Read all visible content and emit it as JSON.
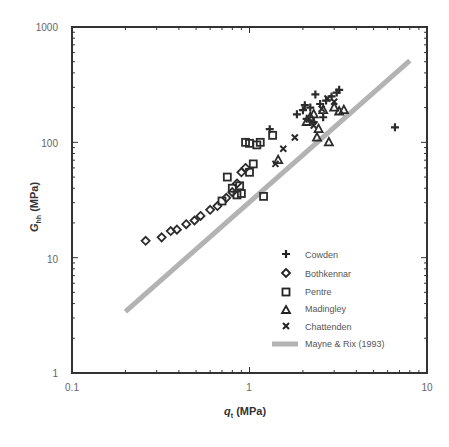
{
  "chart_data": {
    "type": "scatter",
    "title": "",
    "xlabel": "q_t (MPa)",
    "ylabel": "G_hh (MPa)",
    "xscale": "log",
    "yscale": "log",
    "xlim": [
      0.1,
      10
    ],
    "ylim": [
      1,
      1000
    ],
    "x_tick_labels": [
      "0.1",
      "1",
      "10"
    ],
    "y_tick_labels": [
      "1",
      "10",
      "100",
      "1000"
    ],
    "grid": false,
    "legend_position": "lower right (inside)",
    "series": [
      {
        "name": "Cowden",
        "marker": "plus",
        "points": [
          [
            1.3,
            130
          ],
          [
            1.85,
            175
          ],
          [
            2.0,
            190
          ],
          [
            2.1,
            160
          ],
          [
            2.2,
            200
          ],
          [
            2.35,
            260
          ],
          [
            2.5,
            215
          ],
          [
            2.6,
            165
          ],
          [
            2.7,
            230
          ],
          [
            2.9,
            250
          ],
          [
            3.1,
            270
          ],
          [
            3.2,
            285
          ],
          [
            2.3,
            150
          ],
          [
            2.05,
            210
          ],
          [
            6.6,
            135
          ]
        ]
      },
      {
        "name": "Bothkennar",
        "marker": "diamond",
        "points": [
          [
            0.26,
            14
          ],
          [
            0.32,
            15
          ],
          [
            0.36,
            17
          ],
          [
            0.39,
            17.5
          ],
          [
            0.44,
            19.5
          ],
          [
            0.49,
            21
          ],
          [
            0.53,
            23
          ],
          [
            0.6,
            26
          ],
          [
            0.66,
            28
          ],
          [
            0.74,
            33
          ],
          [
            0.8,
            37
          ],
          [
            0.85,
            44
          ],
          [
            0.9,
            55
          ],
          [
            0.95,
            60
          ]
        ]
      },
      {
        "name": "Pentre",
        "marker": "square",
        "points": [
          [
            0.7,
            31
          ],
          [
            0.75,
            50
          ],
          [
            0.8,
            40
          ],
          [
            0.85,
            35
          ],
          [
            0.9,
            36
          ],
          [
            0.95,
            100
          ],
          [
            1.0,
            98
          ],
          [
            1.05,
            65
          ],
          [
            1.1,
            95
          ],
          [
            1.15,
            100
          ],
          [
            1.2,
            34
          ],
          [
            1.0,
            55
          ],
          [
            1.35,
            115
          ],
          [
            0.88,
            42
          ]
        ]
      },
      {
        "name": "Madingley",
        "marker": "triangle",
        "points": [
          [
            1.45,
            70
          ],
          [
            2.1,
            150
          ],
          [
            2.3,
            175
          ],
          [
            2.4,
            110
          ],
          [
            2.45,
            130
          ],
          [
            2.6,
            190
          ],
          [
            2.8,
            100
          ],
          [
            3.0,
            200
          ],
          [
            3.2,
            185
          ],
          [
            3.4,
            190
          ],
          [
            2.2,
            165
          ]
        ]
      },
      {
        "name": "Chattenden",
        "marker": "cross",
        "points": [
          [
            1.55,
            88
          ],
          [
            1.8,
            110
          ],
          [
            1.4,
            65
          ],
          [
            2.3,
            140
          ],
          [
            2.55,
            195
          ],
          [
            2.75,
            240
          ],
          [
            3.0,
            225
          ]
        ]
      }
    ],
    "lines": [
      {
        "name": "Mayne & Rix (1993)",
        "color": "#b3b3b3",
        "x": [
          0.2,
          8.0
        ],
        "y": [
          3.4,
          510
        ]
      }
    ]
  },
  "axes": {
    "x_ticks": [
      {
        "label": "0.1",
        "px": 72
      },
      {
        "label": "1",
        "px": 249
      },
      {
        "label": "10",
        "px": 427
      }
    ],
    "y_ticks": [
      {
        "label": "1",
        "py": 373
      },
      {
        "label": "10",
        "py": 259
      },
      {
        "label": "100",
        "py": 143
      },
      {
        "label": "1000",
        "py": 27
      }
    ],
    "xlabel_main": "q",
    "xlabel_sub": "t",
    "xlabel_unit": " (MPa)",
    "ylabel_main": "G",
    "ylabel_sub": "hh",
    "ylabel_unit": " (MPa)"
  },
  "legend": {
    "items": [
      {
        "label": "Cowden",
        "marker": "plus"
      },
      {
        "label": "Bothkennar",
        "marker": "diamond"
      },
      {
        "label": "Pentre",
        "marker": "square"
      },
      {
        "label": "Madingley",
        "marker": "triangle"
      },
      {
        "label": "Chattenden",
        "marker": "cross"
      },
      {
        "label": "Mayne & Rix (1993)",
        "marker": "line"
      }
    ]
  },
  "colors": {
    "axis": "#333333",
    "marker": "#2b2b2b",
    "trend_line": "#b3b3b3"
  }
}
